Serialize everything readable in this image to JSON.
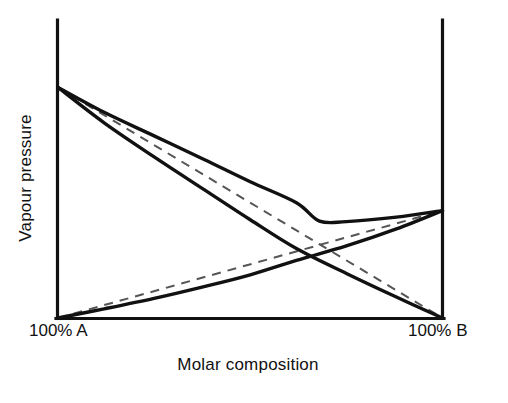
{
  "chart_data": {
    "type": "line",
    "title": "",
    "subtitle": "",
    "xlabel": "Molar composition",
    "ylabel": "Vapour pressure",
    "xlim": [
      0,
      1
    ],
    "ylim": [
      0,
      1
    ],
    "grid": false,
    "legend_position": "none",
    "xtick_labels": [
      "100% A",
      "100% B"
    ],
    "xtick_values": [
      0,
      1
    ],
    "ytick_labels": [],
    "axes_style": "left-bottom-right-open-top",
    "series": [
      {
        "name": "Raoult ideal partial pressure of A",
        "style": "dashed",
        "color": "#555555",
        "x": [
          0,
          1
        ],
        "y": [
          0.88,
          0.0
        ]
      },
      {
        "name": "Raoult ideal partial pressure of B",
        "style": "dashed",
        "color": "#555555",
        "x": [
          0,
          1
        ],
        "y": [
          0.0,
          0.41
        ]
      },
      {
        "name": "Actual partial pressure of A",
        "style": "solid",
        "color": "#111111",
        "x": [
          0.0,
          0.12,
          0.25,
          0.38,
          0.5,
          0.62,
          0.75,
          0.88,
          1.0
        ],
        "y": [
          0.88,
          0.745,
          0.615,
          0.49,
          0.375,
          0.265,
          0.17,
          0.08,
          0.0
        ]
      },
      {
        "name": "Actual partial pressure of B",
        "style": "solid",
        "color": "#111111",
        "x": [
          0.0,
          0.12,
          0.25,
          0.38,
          0.5,
          0.62,
          0.75,
          0.88,
          1.0
        ],
        "y": [
          0.0,
          0.035,
          0.075,
          0.12,
          0.165,
          0.22,
          0.275,
          0.34,
          0.41
        ]
      },
      {
        "name": "Total vapour pressure",
        "style": "solid",
        "color": "#111111",
        "x": [
          0.0,
          0.12,
          0.25,
          0.38,
          0.5,
          0.62,
          0.68,
          0.75,
          0.88,
          1.0
        ],
        "y": [
          0.88,
          0.785,
          0.695,
          0.605,
          0.52,
          0.44,
          0.37,
          0.368,
          0.385,
          0.41
        ]
      }
    ]
  },
  "axes": {
    "y_title": "Vapour pressure",
    "x_title": "Molar composition",
    "left_tick": "100% A",
    "right_tick": "100% B"
  },
  "colors": {
    "axis": "#111111",
    "solid_curve": "#111111",
    "dashed_curve": "#555555",
    "background": "#ffffff"
  }
}
